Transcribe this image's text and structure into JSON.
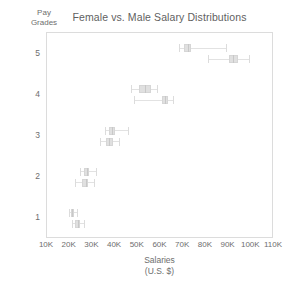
{
  "chart_data": {
    "type": "box",
    "title": "Female vs. Male Salary Distributions",
    "xlabel": "Salaries\n(U.S. $)",
    "ylabel": "Pay\nGrades",
    "xlim": [
      10000,
      110000
    ],
    "ylim": [
      0.5,
      5.5
    ],
    "grid": false,
    "legend": "none",
    "xtick_labels": [
      "10K",
      "20K",
      "30K",
      "40K",
      "50K",
      "60K",
      "70K",
      "80K",
      "90K",
      "100K",
      "110K"
    ],
    "xtick_values": [
      10000,
      20000,
      30000,
      40000,
      50000,
      60000,
      70000,
      80000,
      90000,
      100000,
      110000
    ],
    "ytick_labels": [
      "1",
      "2",
      "3",
      "4",
      "5"
    ],
    "ytick_values": [
      1,
      2,
      3,
      4,
      5
    ],
    "series": [
      {
        "name": "Female",
        "boxes": [
          {
            "grade": 5,
            "whisker_low": 68000,
            "q1": 70500,
            "median": 72000,
            "q3": 73500,
            "whisker_high": 89000
          },
          {
            "grade": 4,
            "whisker_low": 47000,
            "q1": 50500,
            "median": 53000,
            "q3": 56000,
            "whisker_high": 58500
          },
          {
            "grade": 3,
            "whisker_low": 35500,
            "q1": 37500,
            "median": 38500,
            "q3": 40000,
            "whisker_high": 45500
          },
          {
            "grade": 2,
            "whisker_low": 24500,
            "q1": 26500,
            "median": 27500,
            "q3": 28500,
            "whisker_high": 31500
          },
          {
            "grade": 1,
            "whisker_low": 19500,
            "q1": 20500,
            "median": 21000,
            "q3": 21800,
            "whisker_high": 23000
          }
        ]
      },
      {
        "name": "Male",
        "boxes": [
          {
            "grade": 5,
            "whisker_low": 81000,
            "q1": 90000,
            "median": 92000,
            "q3": 94000,
            "whisker_high": 99000
          },
          {
            "grade": 4,
            "whisker_low": 48500,
            "q1": 60500,
            "median": 61800,
            "q3": 63500,
            "whisker_high": 65500
          },
          {
            "grade": 3,
            "whisker_low": 33500,
            "q1": 36000,
            "median": 37500,
            "q3": 39000,
            "whisker_high": 41500
          },
          {
            "grade": 2,
            "whisker_low": 22500,
            "q1": 25500,
            "median": 27000,
            "q3": 28000,
            "whisker_high": 30500
          },
          {
            "grade": 1,
            "whisker_low": 21000,
            "q1": 22500,
            "median": 23500,
            "q3": 24500,
            "whisker_high": 26500
          }
        ]
      }
    ]
  },
  "colors": {
    "box_fill": "#e0e0e0",
    "box_border": "#d6d6d6",
    "whisker": "#e2e2e2",
    "frame": "#dcdcdc",
    "text": "#6e6e6e",
    "title_text": "#5f5f5f"
  }
}
